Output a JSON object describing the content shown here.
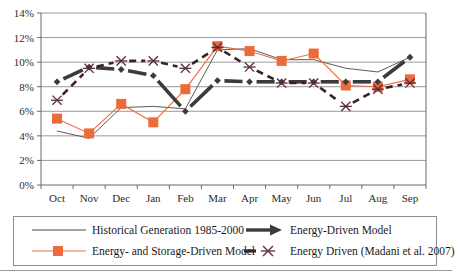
{
  "chart_data": {
    "type": "line",
    "title": "",
    "subtitle": "",
    "xlabel": "",
    "ylabel": "",
    "categories": [
      "Oct",
      "Nov",
      "Dec",
      "Jan",
      "Feb",
      "Mar",
      "Apr",
      "May",
      "Jun",
      "Jul",
      "Aug",
      "Sep"
    ],
    "ylim": [
      0,
      14
    ],
    "ytick_labels": [
      "0%",
      "2%",
      "4%",
      "6%",
      "8%",
      "10%",
      "12%",
      "14%"
    ],
    "ytick_values": [
      0,
      2,
      4,
      6,
      8,
      10,
      12,
      14
    ],
    "grid": "horizontal",
    "legend_position": "bottom",
    "series": [
      {
        "name": "Historical Generation 1985-2000",
        "color": "#4a4a4a",
        "style": "thin-solid-no-marker",
        "values": [
          4.4,
          3.8,
          6.3,
          6.4,
          6.2,
          11.0,
          11.1,
          10.2,
          10.2,
          9.5,
          9.2,
          10.4
        ]
      },
      {
        "name": "Energy- and Storage-Driven Model",
        "color": "#ED6A3A",
        "style": "thin-solid-square-marker",
        "values": [
          5.4,
          4.2,
          6.6,
          5.1,
          7.8,
          11.3,
          10.9,
          10.1,
          10.7,
          8.1,
          8.0,
          8.6
        ]
      },
      {
        "name": "Energy-Driven Model",
        "color": "#3b3b3b",
        "style": "thick-solid-diamond-marker",
        "values": [
          8.4,
          9.6,
          9.4,
          8.9,
          6.0,
          8.5,
          8.4,
          8.4,
          8.4,
          8.4,
          8.4,
          10.4
        ]
      },
      {
        "name": "Energy Driven (Madani et al. 2007)",
        "color": "#5a2b3a",
        "style": "dashed-x-marker",
        "values": [
          6.9,
          9.5,
          10.1,
          10.1,
          9.5,
          11.2,
          9.6,
          8.3,
          8.3,
          6.4,
          7.8,
          8.3
        ]
      }
    ]
  },
  "legend": {
    "items": [
      {
        "label": "Historical Generation 1985-2000",
        "marker": "thin-line"
      },
      {
        "label": "Energy- and Storage-Driven Model",
        "marker": "orange-square-line"
      },
      {
        "label": "Energy-Driven Model",
        "marker": "thick-arrow"
      },
      {
        "label": "Energy Driven (Madani et al. 2007)",
        "marker": "dashed-x"
      }
    ]
  },
  "colors": {
    "orange": "#ED6A3A",
    "dark": "#3b3b3b",
    "maroon": "#5a2b3a",
    "grid": "#7f7f7f",
    "axis": "#6b6b6b"
  }
}
